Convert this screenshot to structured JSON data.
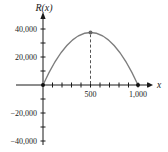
{
  "chart_data": {
    "type": "line",
    "title": "",
    "ylabel": "R(x)",
    "xlabel": "x",
    "curve": {
      "description": "downward-opening parabola (revenue function)",
      "zeros": [
        0,
        1000
      ],
      "vertex": {
        "x": 500,
        "y": 37500
      },
      "points": [
        [
          0,
          0
        ],
        [
          100,
          13500
        ],
        [
          200,
          24000
        ],
        [
          300,
          31500
        ],
        [
          400,
          36000
        ],
        [
          500,
          37500
        ],
        [
          600,
          36000
        ],
        [
          700,
          31500
        ],
        [
          800,
          24000
        ],
        [
          900,
          13500
        ],
        [
          1000,
          0
        ]
      ]
    },
    "x_axis": {
      "range": [
        0,
        1100
      ],
      "tick_step": 100,
      "labeled_ticks": [
        500,
        1000
      ],
      "tick_labels": [
        "500",
        "1,000"
      ]
    },
    "y_axis": {
      "range": [
        -40000,
        40000
      ],
      "tick_step": 10000,
      "labeled_ticks": [
        40000,
        20000,
        -20000,
        -40000
      ],
      "tick_labels": [
        "40,000",
        "20,000",
        "−20,000",
        "−40,000"
      ]
    },
    "marked_points": [
      [
        0,
        0
      ],
      [
        1000,
        0
      ]
    ],
    "dashed_line_to_vertex": true,
    "legend": null,
    "grid": false,
    "colors": {
      "axis": "#1a1a1a",
      "curve": "#7d7d7d",
      "dashed": "#555555",
      "vertex_dot": "#666666",
      "endpoint_dot": "#111111",
      "text": "#1a1a1a",
      "background": "#ffffff"
    }
  }
}
